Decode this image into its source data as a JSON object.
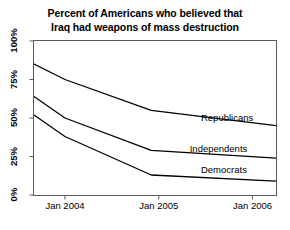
{
  "chart_data": {
    "type": "line",
    "title": "Percent of Americans who believed that Iraq had weapons of mass destruction",
    "title_lines": [
      "Percent of Americans who believed that",
      "Iraq had weapons of mass destruction"
    ],
    "xlabel": "",
    "ylabel": "",
    "ylim": [
      0,
      100
    ],
    "xlim": [
      2003.67,
      2006.25
    ],
    "grid": false,
    "legend_position": "inline-right",
    "y_ticks": [
      0,
      25,
      50,
      75,
      100
    ],
    "y_tick_labels": [
      "0%",
      "25%",
      "50%",
      "75%",
      "100%"
    ],
    "x_ticks": [
      2004.0,
      2005.0,
      2006.0
    ],
    "x_tick_labels": [
      "Jan 2004",
      "Jan 2005",
      "Jan 2006"
    ],
    "x": [
      2003.67,
      2004.0,
      2004.92,
      2006.25
    ],
    "series": [
      {
        "name": "Republicans",
        "label": "Republicans",
        "color": "#000000",
        "values": [
          85,
          75,
          55,
          45
        ]
      },
      {
        "name": "Independents",
        "label": "Independents",
        "color": "#000000",
        "values": [
          64,
          50,
          29,
          24
        ]
      },
      {
        "name": "Democrats",
        "label": "Democrats",
        "color": "#000000",
        "values": [
          52,
          38,
          13,
          9
        ]
      }
    ],
    "annotations": [
      {
        "text": "Republicans",
        "x": 2005.45,
        "y": 50
      },
      {
        "text": "Independents",
        "x": 2005.33,
        "y": 30
      },
      {
        "text": "Democrats",
        "x": 2005.45,
        "y": 16
      }
    ]
  },
  "colors": {
    "background": "#ffffff",
    "axis": "#5a5a5a",
    "line": "#000000",
    "text": "#000000"
  }
}
